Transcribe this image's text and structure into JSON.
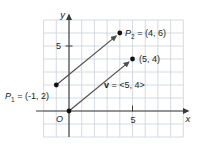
{
  "colors": {
    "background": "#ffffff",
    "grid": "#c9d2da",
    "axis": "#3a3a3a",
    "vector": "#4f4f4f",
    "point": "#111111",
    "text": "#1c1c1c",
    "vector_label": "#8b9093"
  },
  "axes": {
    "x_label": "x",
    "y_label": "y",
    "x_tick_label": "5",
    "y_tick_label": "5",
    "origin_label": "O",
    "x_range": [
      -2,
      9
    ],
    "y_range": [
      -2,
      7
    ]
  },
  "points": {
    "p1": {
      "name": "P",
      "sub": "1",
      "rest": " = (-1, 2)",
      "x": -1,
      "y": 2
    },
    "p2": {
      "name": "P",
      "sub": "2",
      "rest": " = (4, 6)",
      "x": 4,
      "y": 6
    },
    "p3": {
      "label": "(5, 4)",
      "x": 5,
      "y": 4
    }
  },
  "vector_label": {
    "symbol": "v",
    "rest": " = <5, 4>"
  },
  "vectors": [
    {
      "from": [
        -1,
        2
      ],
      "to": [
        4,
        6
      ]
    },
    {
      "from": [
        0,
        0
      ],
      "to": [
        5,
        4
      ]
    }
  ]
}
